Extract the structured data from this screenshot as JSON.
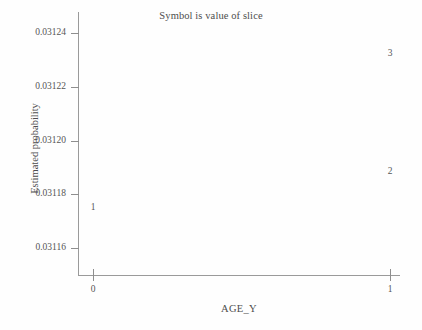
{
  "chart_data": {
    "type": "scatter",
    "title": "Symbol is value of slice",
    "xlabel": "AGE_Y",
    "ylabel": "Estimated probability",
    "grid": false,
    "legend": "none",
    "xlim": [
      0,
      1
    ],
    "ylim": [
      0.03115,
      0.031248
    ],
    "x_ticks": [
      {
        "value": 0,
        "label": "0"
      },
      {
        "value": 1,
        "label": "1"
      }
    ],
    "y_ticks": [
      {
        "value": 0.03116,
        "label": "0.03116"
      },
      {
        "value": 0.03118,
        "label": "0.03118"
      },
      {
        "value": 0.0312,
        "label": "0.03120"
      },
      {
        "value": 0.03122,
        "label": "0.03122"
      },
      {
        "value": 0.03124,
        "label": "0.03124"
      }
    ],
    "marker_style": "digit-symbol-is-slice-value",
    "points": [
      {
        "symbol": "1",
        "slice": 1,
        "x": 0,
        "y": 0.031175
      },
      {
        "symbol": "2",
        "slice": 2,
        "x": 1,
        "y": 0.0311885
      },
      {
        "symbol": "3",
        "slice": 3,
        "x": 1,
        "y": 0.0312325
      }
    ]
  },
  "colors": {
    "background": "#fefefe",
    "axis": "#9a9a9a",
    "tick": "#8e8e8e",
    "text": "#555555",
    "title": "#4d4d4d",
    "symbol": "#565656"
  }
}
